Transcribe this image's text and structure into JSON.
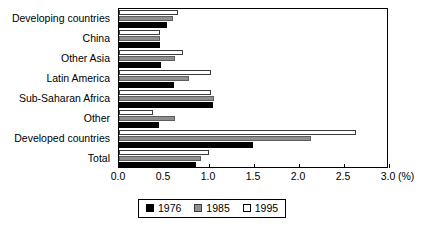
{
  "chart_data": {
    "type": "bar",
    "orientation": "horizontal",
    "title": "",
    "xlabel": "(%)",
    "ylabel": "",
    "xlim": [
      0.0,
      3.0
    ],
    "xticks": [
      "0.0",
      "0.5",
      "1.0",
      "1.5",
      "2.0",
      "2.5",
      "3.0"
    ],
    "xtick_values": [
      0.0,
      0.5,
      1.0,
      1.5,
      2.0,
      2.5,
      3.0
    ],
    "grid": false,
    "legend_position": "bottom-center",
    "categories": [
      "Developing countries",
      "China",
      "Other Asia",
      "Latin America",
      "Sub-Saharan Africa",
      "Other",
      "Developed countries",
      "Total"
    ],
    "series": [
      {
        "name": "1976",
        "color": "#000000",
        "values": [
          0.53,
          0.45,
          0.47,
          0.61,
          1.04,
          0.44,
          1.49,
          0.85
        ]
      },
      {
        "name": "1985",
        "color": "#8f8f8f",
        "values": [
          0.6,
          0.46,
          0.62,
          0.78,
          1.05,
          0.62,
          2.13,
          0.91
        ]
      },
      {
        "name": "1995",
        "color": "#ffffff",
        "values": [
          0.66,
          0.45,
          0.71,
          1.02,
          1.02,
          0.38,
          2.63,
          1.0
        ]
      }
    ]
  },
  "legend": {
    "items": [
      {
        "label": "1976"
      },
      {
        "label": "1985"
      },
      {
        "label": "1995"
      }
    ]
  }
}
